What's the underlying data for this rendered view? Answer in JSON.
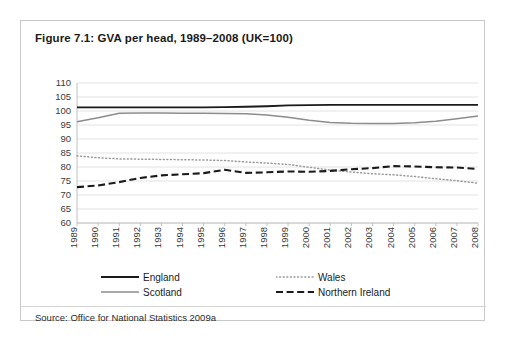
{
  "figure": {
    "title": "Figure 7.1: GVA per head, 1989–2008 (UK=100)",
    "source": "Source: Office for National Statistics 2009a"
  },
  "legend": {
    "position": "below-plot",
    "entries": [
      {
        "label": "England",
        "style": "solid",
        "color": "#1a1a1a",
        "width": 1.9
      },
      {
        "label": "Scotland",
        "style": "solid",
        "color": "#8c8c8c",
        "width": 1.5
      },
      {
        "label": "Wales",
        "style": "dotted",
        "color": "#9a9a9a",
        "width": 1.4
      },
      {
        "label": "Northern Ireland",
        "style": "dashed",
        "color": "#1a1a1a",
        "width": 2.1
      }
    ]
  },
  "chart_data": {
    "type": "line",
    "title": "Figure 7.1: GVA per head, 1989–2008 (UK=100)",
    "xlabel": "",
    "ylabel": "",
    "ylim": [
      60,
      110
    ],
    "yticks": [
      60,
      65,
      70,
      75,
      80,
      85,
      90,
      95,
      100,
      105,
      110
    ],
    "grid": true,
    "x": [
      1989,
      1990,
      1991,
      1992,
      1993,
      1994,
      1995,
      1996,
      1997,
      1998,
      1999,
      2000,
      2001,
      2002,
      2003,
      2004,
      2005,
      2006,
      2007,
      2008
    ],
    "categories": [
      "1989",
      "1990",
      "1991",
      "1992",
      "1993",
      "1994",
      "1995",
      "1996",
      "1997",
      "1998",
      "1999",
      "2000",
      "2001",
      "2002",
      "2003",
      "2004",
      "2005",
      "2006",
      "2007",
      "2008"
    ],
    "series": [
      {
        "name": "England",
        "color": "#1a1a1a",
        "style": "solid",
        "values": [
          101.3,
          101.3,
          101.3,
          101.3,
          101.3,
          101.3,
          101.3,
          101.4,
          101.5,
          101.7,
          102.0,
          102.1,
          102.2,
          102.2,
          102.2,
          102.2,
          102.2,
          102.2,
          102.2,
          102.2
        ]
      },
      {
        "name": "Scotland",
        "color": "#8c8c8c",
        "style": "solid",
        "values": [
          96.2,
          97.6,
          99.2,
          99.3,
          99.3,
          99.2,
          99.2,
          99.1,
          99.0,
          98.6,
          97.8,
          96.7,
          95.9,
          95.6,
          95.5,
          95.5,
          95.8,
          96.3,
          97.2,
          98.2
        ]
      },
      {
        "name": "Wales",
        "color": "#9a9a9a",
        "style": "dotted",
        "values": [
          84.0,
          83.3,
          82.9,
          82.8,
          82.7,
          82.6,
          82.5,
          82.3,
          81.8,
          81.4,
          80.9,
          79.9,
          78.9,
          78.2,
          77.6,
          77.2,
          76.6,
          75.8,
          75.1,
          74.2
        ]
      },
      {
        "name": "Northern Ireland",
        "color": "#1a1a1a",
        "style": "dashed",
        "values": [
          72.8,
          73.4,
          74.6,
          76.1,
          77.0,
          77.4,
          77.8,
          79.0,
          77.9,
          78.1,
          78.4,
          78.3,
          78.6,
          79.2,
          79.6,
          80.3,
          80.2,
          79.9,
          79.8,
          79.3
        ]
      }
    ]
  }
}
